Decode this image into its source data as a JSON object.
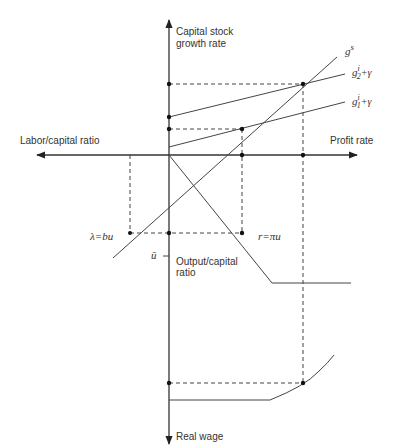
{
  "diagram": {
    "axes": {
      "top_label_line1": "Capital stock",
      "top_label_line2": "growth rate",
      "left_label": "Labor/capital ratio",
      "right_label": "Profit rate",
      "bottom_mid_label_line1": "Output/capital",
      "bottom_mid_label_line2": "ratio",
      "bottom_label": "Real wage"
    },
    "curves": {
      "gs": {
        "base": "g",
        "sup": "s"
      },
      "g2": {
        "base": "g",
        "sup": "i",
        "sub": "2",
        "suffix": "+γ"
      },
      "g1": {
        "base": "g",
        "sup": "i",
        "sub": "1",
        "suffix": "+γ"
      },
      "labor_line": "λ=bu",
      "profit_line": "r=πu",
      "u_bar": "ū"
    },
    "colors": {
      "line": "#333333",
      "background": "#ffffff"
    }
  }
}
